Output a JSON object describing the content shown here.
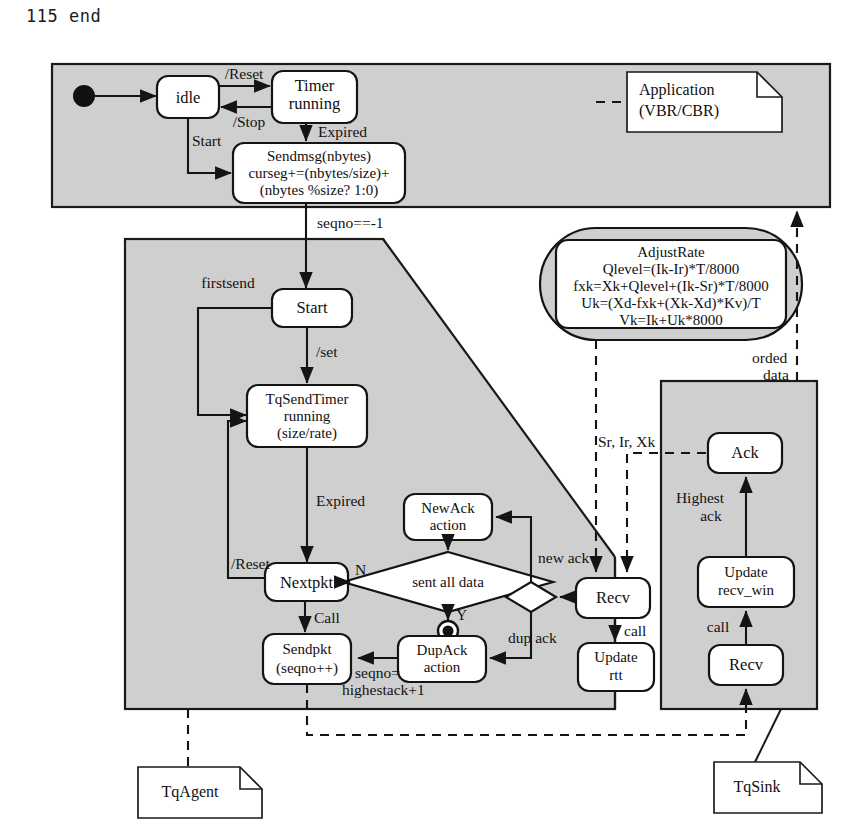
{
  "code_line": "115 end",
  "colors": {
    "panel_fill": "#cfcfcf",
    "state_fill": "#ffffff",
    "line": "#141414",
    "page_background": "#ffffff"
  },
  "application_panel": {
    "name": "application-layer-panel",
    "states": [
      {
        "id": "idle",
        "label": "idle"
      },
      {
        "id": "timer_running",
        "label_lines": [
          "Timer",
          "running"
        ]
      },
      {
        "id": "sendmsg",
        "label_lines": [
          "Sendmsg(nbytes)",
          "curseg+=(nbytes/size)+",
          "(nbytes %size? 1:0)"
        ]
      }
    ],
    "initial_state": "filled-circle",
    "transitions": [
      {
        "label": "/Reset",
        "from": "idle",
        "to": "timer_running"
      },
      {
        "label": "/Stop",
        "from": "timer_running",
        "to": "idle"
      },
      {
        "label": "Expired",
        "from": "timer_running",
        "to": "sendmsg"
      },
      {
        "label": "Start",
        "from": "idle",
        "to": "sendmsg"
      }
    ],
    "note": {
      "label_lines": [
        "Application",
        "(VBR/CBR)"
      ]
    }
  },
  "agent_panel": {
    "name": "tqagent-panel",
    "entry_label": "seqno==-1",
    "states": [
      {
        "id": "start",
        "label": "Start"
      },
      {
        "id": "tqsendtimer",
        "label_lines": [
          "TqSendTimer",
          "running",
          "(size/rate)"
        ]
      },
      {
        "id": "nextpkt",
        "label": "Nextpkt"
      },
      {
        "id": "sendpkt",
        "label_lines": [
          "Sendpkt",
          "(seqno++)"
        ]
      },
      {
        "id": "newack",
        "label_lines": [
          "NewAck",
          "action"
        ]
      },
      {
        "id": "dupack",
        "label_lines": [
          "DupAck",
          "action"
        ]
      },
      {
        "id": "recv",
        "label": "Recv"
      },
      {
        "id": "update_rtt",
        "label_lines": [
          "Update",
          "rtt"
        ]
      }
    ],
    "decision": {
      "label": "sent all data",
      "yes_label": "Y",
      "no_label": "N"
    },
    "final_state": "bullseye",
    "transitions": [
      {
        "label": "firstsend"
      },
      {
        "label": "/set"
      },
      {
        "label": "Expired"
      },
      {
        "label": "/Reset"
      },
      {
        "label": "Call"
      },
      {
        "label": "seqno=",
        "label2": "highestack+1"
      },
      {
        "label": "new ack"
      },
      {
        "label": "dup ack"
      },
      {
        "label": "call"
      }
    ],
    "note": {
      "label": "TqAgent"
    }
  },
  "adjust_rate": {
    "name": "adjustrate-activity",
    "title": "AdjustRate",
    "formulas": [
      "Qlevel=(Ik-Ir)*T/8000",
      "fxk=Xk+Qlevel+(Ik-Sr)*T/8000",
      "Uk=(Xd-fxk+(Xk-Xd)*Kv)/T",
      "Vk=Ik+Uk*8000"
    ]
  },
  "sink_panel": {
    "name": "tqsink-panel",
    "states": [
      {
        "id": "ack",
        "label": "Ack"
      },
      {
        "id": "update_recv_win",
        "label_lines": [
          "Update",
          "recv_win"
        ]
      },
      {
        "id": "recv",
        "label": "Recv"
      }
    ],
    "transitions": [
      {
        "label": "Highest",
        "label2": "ack"
      },
      {
        "label": "call"
      }
    ],
    "note": {
      "label": "TqSink"
    }
  },
  "dataflow_labels": {
    "feedback": "Sr, Ir, Xk",
    "ordered_data": "orded",
    "ordered_data2": "data"
  }
}
